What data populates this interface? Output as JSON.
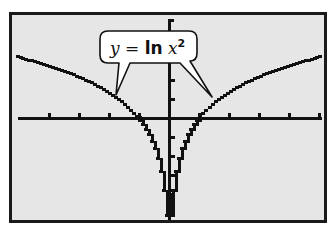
{
  "chart_data": {
    "type": "line",
    "title": "",
    "annotation": {
      "text_y": "y",
      "text_eq": " = ",
      "text_ln": "ln",
      "text_x": " x",
      "text_exp": "2",
      "full": "y = ln x²"
    },
    "function": "y = ln(x^2)",
    "xlim": [
      -5,
      5.1
    ],
    "ylim": [
      -5.6,
      5.2
    ],
    "x_tick_step": 1,
    "y_tick_step": 1,
    "grid": false,
    "legend": "none",
    "xlabel": "",
    "ylabel": "",
    "series": [
      {
        "name": "y = ln x²",
        "x": [
          -5,
          -4,
          -3,
          -2,
          -1,
          -0.5,
          -0.25,
          0.25,
          0.5,
          1,
          2,
          3,
          4,
          5
        ],
        "y": [
          3.22,
          2.77,
          2.2,
          1.39,
          0,
          -1.39,
          -2.77,
          -2.77,
          -1.39,
          0,
          1.39,
          2.2,
          2.77,
          3.22
        ]
      }
    ],
    "x_intercepts": [
      -1,
      1
    ],
    "vertical_asymptote": 0
  },
  "colors": {
    "screen_bg": "#e6e6e6",
    "ink": "#111111",
    "frame": "#1a1a1a"
  }
}
